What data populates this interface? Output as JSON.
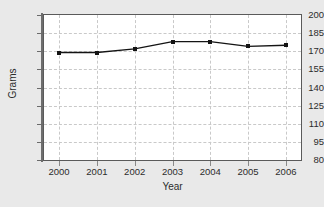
{
  "chart_data": {
    "type": "line",
    "title": "",
    "xlabel": "Year",
    "ylabel": "Grams",
    "categories": [
      "2000",
      "2001",
      "2002",
      "2003",
      "2004",
      "2005",
      "2006"
    ],
    "x": [
      2000,
      2001,
      2002,
      2003,
      2004,
      2005,
      2006
    ],
    "values": [
      169,
      169,
      172,
      178,
      178,
      174,
      175
    ],
    "series": [
      {
        "name": "Grams",
        "values": [
          169,
          169,
          172,
          178,
          178,
          174,
          175
        ]
      }
    ],
    "xlim": [
      1999.6,
      2006.4
    ],
    "ylim": [
      80,
      200
    ],
    "yticks": [
      80,
      95,
      110,
      125,
      140,
      155,
      170,
      185,
      200
    ],
    "ytick_labels": [
      "80",
      "95",
      "110",
      "125",
      "140",
      "155",
      "170",
      "185",
      "200"
    ],
    "xticks": [
      2000,
      2001,
      2002,
      2003,
      2004,
      2005,
      2006
    ],
    "xtick_labels": [
      "2000",
      "2001",
      "2002",
      "2003",
      "2004",
      "2005",
      "2006"
    ],
    "grid": true,
    "grid_style": "dashed",
    "legend": false,
    "legend_position": "none",
    "marker": "square",
    "colors": {
      "line": "#141414",
      "marker": "#141414",
      "grid": "#c9c9c9",
      "plot_background": "#ffffff",
      "figure_background": "#e9e9e9",
      "axis": "#5a5a5a",
      "text": "#2c2c2c"
    }
  }
}
